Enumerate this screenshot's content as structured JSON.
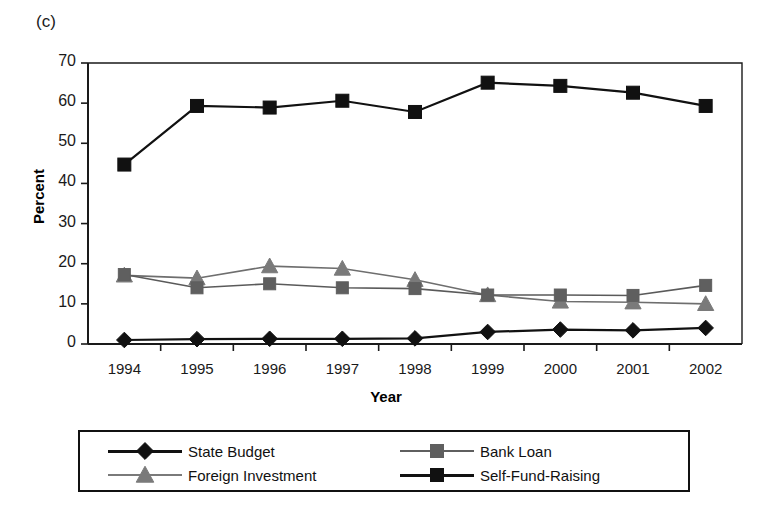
{
  "figure": {
    "panel_label": "(c)",
    "background_color": "#ffffff"
  },
  "chart_data": {
    "type": "line",
    "title": "",
    "subtitle": "",
    "xlabel": "Year",
    "ylabel": "Percent",
    "categories": [
      "1994",
      "1995",
      "1996",
      "1997",
      "1998",
      "1999",
      "2000",
      "2001",
      "2002"
    ],
    "x": [
      1994,
      1995,
      1996,
      1997,
      1998,
      1999,
      2000,
      2001,
      2002
    ],
    "ylim": [
      0,
      70
    ],
    "yticks": [
      0,
      10,
      20,
      30,
      40,
      50,
      60,
      70
    ],
    "ytick_labels": [
      "0",
      "10",
      "20",
      "30",
      "40",
      "50",
      "60",
      "70"
    ],
    "grid": false,
    "legend_position": "bottom",
    "series": [
      {
        "name": "State Budget",
        "marker": "diamond",
        "color": "#111111",
        "line_color": "#111111",
        "values": [
          1.0,
          1.2,
          1.3,
          1.3,
          1.4,
          3.0,
          3.6,
          3.4,
          4.0
        ]
      },
      {
        "name": "Bank Loan",
        "marker": "square",
        "color": "#5f5f5f",
        "line_color": "#5a5a5a",
        "values": [
          17.3,
          14.0,
          15.0,
          14.0,
          13.8,
          12.2,
          12.2,
          12.1,
          14.6
        ]
      },
      {
        "name": "Foreign Investment",
        "marker": "triangle",
        "color": "#7a7a7a",
        "line_color": "#6e6e6e",
        "values": [
          17.1,
          16.4,
          19.4,
          18.8,
          16.0,
          12.2,
          10.6,
          10.4,
          10.0
        ]
      },
      {
        "name": "Self-Fund-Raising",
        "marker": "square",
        "color": "#111111",
        "line_color": "#111111",
        "values": [
          44.7,
          59.3,
          58.9,
          60.6,
          57.8,
          65.1,
          64.3,
          62.6,
          59.3
        ]
      }
    ]
  },
  "legend": {
    "entries": [
      {
        "label": "State Budget",
        "marker": "diamond",
        "color": "#111111"
      },
      {
        "label": "Bank Loan",
        "marker": "square",
        "color": "#5f5f5f"
      },
      {
        "label": "Foreign Investment",
        "marker": "triangle",
        "color": "#7a7a7a"
      },
      {
        "label": "Self-Fund-Raising",
        "marker": "square",
        "color": "#111111"
      }
    ]
  }
}
